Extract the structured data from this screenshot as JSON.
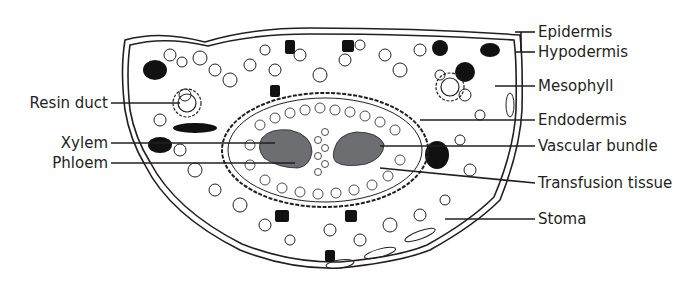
{
  "diagram": {
    "colors": {
      "outline": "#231f20",
      "vascular_fill": "#6d6e71",
      "dark_cells": "#111111",
      "background": "#ffffff"
    },
    "labels_left": [
      {
        "text": "Resin duct",
        "x": 111,
        "y": 103
      },
      {
        "text": "Xylem",
        "x": 111,
        "y": 143
      },
      {
        "text": "Phloem",
        "x": 111,
        "y": 163
      }
    ],
    "labels_right": [
      {
        "text": "Epidermis",
        "x": 537,
        "y": 10
      },
      {
        "text": "Hypodermis",
        "x": 537,
        "y": 30
      },
      {
        "text": "Mesophyll",
        "x": 537,
        "y": 64
      },
      {
        "text": "Endodermis",
        "x": 537,
        "y": 101
      },
      {
        "text": "Vascular bundle",
        "x": 537,
        "y": 127
      },
      {
        "text": "Transfusion tissue",
        "x": 537,
        "y": 164
      },
      {
        "text": "Stoma",
        "x": 537,
        "y": 200
      }
    ]
  }
}
